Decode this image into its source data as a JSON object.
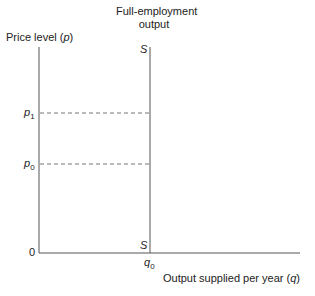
{
  "diagram": {
    "y_axis_label": "Price level",
    "y_axis_symbol": "p",
    "x_axis_label": "Output supplied per year",
    "x_axis_symbol": "q",
    "curve_title_line1": "Full-employment",
    "curve_title_line2": "output",
    "curve_label_top": "S",
    "curve_label_bottom": "S",
    "origin_label": "0",
    "price_levels": [
      {
        "symbol": "p",
        "subscript": "1"
      },
      {
        "symbol": "p",
        "subscript": "0"
      }
    ],
    "output_level": {
      "symbol": "q",
      "subscript": "0"
    },
    "colors": {
      "axis": "#555555",
      "dashed": "#777777"
    }
  }
}
